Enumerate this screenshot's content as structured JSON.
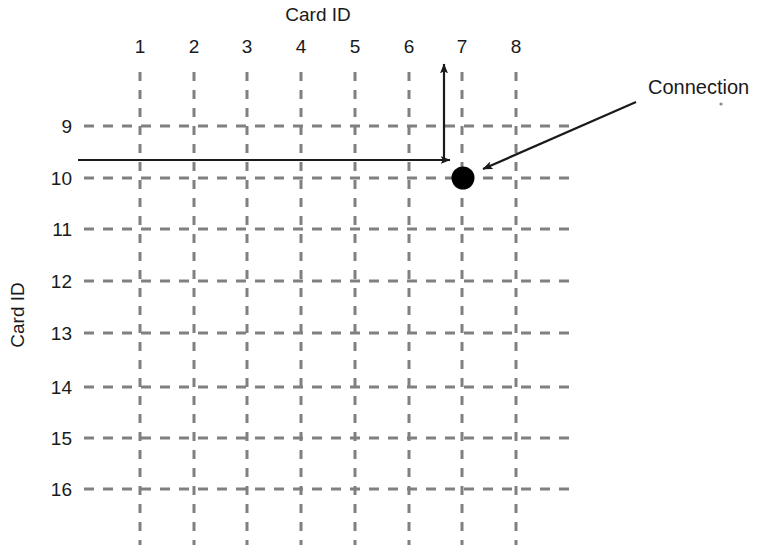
{
  "figure": {
    "type": "grid-diagram",
    "background_color": "#ffffff",
    "top_axis_title": "Card ID",
    "left_axis_title": "Card ID",
    "grid_color": "#808080",
    "ink_color": "#1a1a1a",
    "node_color": "#000000"
  },
  "columns": {
    "title": "Card ID",
    "labels": [
      "1",
      "2",
      "3",
      "4",
      "5",
      "6",
      "7",
      "8"
    ],
    "x_positions": [
      140,
      194,
      247,
      301,
      355,
      409,
      462,
      516
    ],
    "label_y": 47,
    "line_top": 72,
    "line_bottom": 545
  },
  "rows": {
    "title": "Card ID",
    "labels": [
      "9",
      "10",
      "11",
      "12",
      "13",
      "14",
      "15",
      "16"
    ],
    "y_positions": [
      126,
      178,
      229,
      281,
      333,
      387,
      438,
      489
    ],
    "label_x": 65,
    "line_left": 84,
    "line_right": 570
  },
  "connection": {
    "label": "Connection",
    "label_x": 648,
    "label_y": 94,
    "node_col": "7",
    "node_row": "10",
    "node_cx": 463,
    "node_cy": 178,
    "node_r": 11,
    "leader_from_x": 636,
    "leader_from_y": 102,
    "leader_to_x": 481,
    "leader_to_y": 169
  },
  "arrows": {
    "horizontal": {
      "name": "row-signal-arrow",
      "x_start": 78,
      "x_end": 452,
      "y": 160
    },
    "vertical": {
      "name": "column-signal-arrow",
      "x": 444,
      "y_start": 160,
      "y_end": 62
    }
  }
}
